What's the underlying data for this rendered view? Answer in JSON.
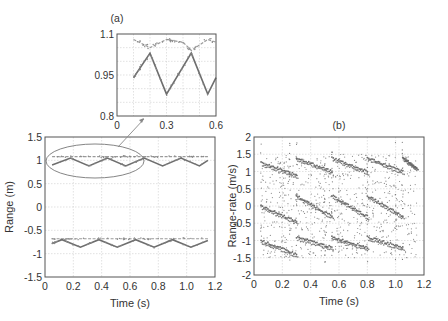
{
  "chart_data": [
    {
      "id": "inset",
      "panel_label": "(a)",
      "type": "line",
      "title": "(a)",
      "xlabel": "",
      "ylabel": "",
      "xlim": [
        0,
        0.6
      ],
      "ylim": [
        0.8,
        1.1
      ],
      "xticks": [
        "0",
        "0.3",
        "0.6"
      ],
      "yticks": [
        "0.8",
        "0.95",
        "1.1"
      ],
      "grid": true,
      "series": [
        {
          "name": "upper track",
          "x": [
            0.1,
            0.2,
            0.3,
            0.4,
            0.45,
            0.55,
            0.6
          ],
          "values": [
            1.08,
            1.05,
            1.08,
            1.07,
            1.04,
            1.08,
            1.07
          ]
        },
        {
          "name": "zigzag track",
          "x": [
            0.1,
            0.2,
            0.3,
            0.45,
            0.55,
            0.6
          ],
          "values": [
            0.94,
            1.03,
            0.88,
            1.03,
            0.88,
            0.94
          ]
        }
      ]
    },
    {
      "id": "range",
      "type": "scatter",
      "title": "",
      "xlabel": "Time (s)",
      "ylabel": "Range (m)",
      "xlim": [
        0,
        1.2
      ],
      "ylim": [
        -1.5,
        1.5
      ],
      "xticks": [
        "0",
        "0.2",
        "0.4",
        "0.6",
        "0.8",
        "1.0",
        "1.2"
      ],
      "yticks": [
        "1.5",
        "1",
        "0.5",
        "0",
        "-0.5",
        "-1",
        "-1.5"
      ],
      "grid": true,
      "annotation": "ellipse around upper tracks with arrow to inset (a)",
      "series": [
        {
          "name": "upper flat",
          "x": [
            0.05,
            1.15
          ],
          "values": [
            1.08,
            1.08
          ]
        },
        {
          "name": "upper zigzag",
          "x": [
            0.05,
            0.18,
            0.31,
            0.44,
            0.57,
            0.7,
            0.83,
            0.96,
            1.09,
            1.15
          ],
          "values": [
            0.9,
            1.05,
            0.88,
            1.05,
            0.88,
            1.05,
            0.88,
            1.05,
            0.88,
            1.0
          ]
        },
        {
          "name": "lower flat",
          "x": [
            0.05,
            1.15
          ],
          "values": [
            -0.68,
            -0.68
          ]
        },
        {
          "name": "lower zigzag",
          "x": [
            0.05,
            0.12,
            0.25,
            0.38,
            0.51,
            0.64,
            0.77,
            0.9,
            1.03,
            1.15
          ],
          "values": [
            -0.78,
            -0.7,
            -0.86,
            -0.7,
            -0.86,
            -0.7,
            -0.86,
            -0.7,
            -0.86,
            -0.72
          ]
        }
      ]
    },
    {
      "id": "range-rate",
      "panel_label": "(b)",
      "type": "scatter",
      "title": "(b)",
      "xlabel": "Time (s)",
      "ylabel": "Range-rate (m/s)",
      "xlim": [
        0,
        1.2
      ],
      "ylim": [
        -2,
        2
      ],
      "xticks": [
        "0",
        "0.2",
        "0.4",
        "0.6",
        "0.8",
        "1.0",
        "1.2"
      ],
      "yticks": [
        "2",
        "1.5",
        "1",
        "0.5",
        "0",
        "-0.5",
        "-1",
        "-1.5",
        "-2"
      ],
      "grid": true,
      "series": [
        {
          "name": "sawtooth upper",
          "x": [
            0.05,
            0.3,
            0.3,
            0.55,
            0.55,
            0.8,
            0.8,
            1.05,
            1.05,
            1.15
          ],
          "values": [
            1.25,
            0.9,
            1.4,
            1.0,
            1.4,
            1.0,
            1.4,
            1.0,
            1.4,
            1.1
          ]
        },
        {
          "name": "sawtooth middle",
          "x": [
            0.05,
            0.3,
            0.3,
            0.55,
            0.55,
            0.8,
            0.8,
            1.05
          ],
          "values": [
            0.0,
            -0.45,
            0.3,
            -0.3,
            0.3,
            -0.3,
            0.3,
            -0.3
          ]
        },
        {
          "name": "sawtooth lower",
          "x": [
            0.05,
            0.3,
            0.3,
            0.55,
            0.55,
            0.8,
            0.8,
            1.05
          ],
          "values": [
            -1.0,
            -1.4,
            -0.9,
            -1.2,
            -0.9,
            -1.2,
            -0.9,
            -1.2
          ]
        }
      ]
    }
  ]
}
